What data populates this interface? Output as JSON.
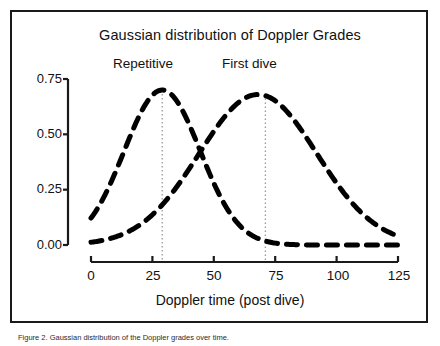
{
  "figure": {
    "title": "Gaussian distribution of Doppler Grades",
    "caption": "Figure 2. Gaussian distribution of the Doppler grades over time.",
    "frame_color": "#1a1a1a",
    "background": "#ffffff",
    "curve_color": "#000000",
    "dropline_color": "#9a9a9a"
  },
  "axes": {
    "x_label": "Doppler time (post dive)",
    "x_ticks": [
      "0",
      "25",
      "50",
      "75",
      "100",
      "125"
    ],
    "y_ticks": [
      "0.75",
      "0.50",
      "0.25",
      "0.00"
    ]
  },
  "annotations": {
    "repetitive": "Repetitive",
    "first_dive": "First dive"
  },
  "chart_data": {
    "type": "line",
    "title": "Gaussian distribution of Doppler Grades",
    "xlabel": "Doppler time (post dive)",
    "ylabel": "",
    "xlim": [
      0,
      125
    ],
    "ylim": [
      0.0,
      0.75
    ],
    "xticks": [
      0,
      25,
      50,
      75,
      100,
      125
    ],
    "yticks": [
      0.0,
      0.25,
      0.5,
      0.75
    ],
    "grid": false,
    "legend": "inline annotations above each peak",
    "linestyle": "dashed",
    "linewidth_px": 5,
    "series": [
      {
        "name": "Repetitive",
        "label_position": {
          "x": 22,
          "y": 0.78
        },
        "dropline_x": 29,
        "peak": {
          "x": 29,
          "y": 0.7
        },
        "gaussian": {
          "mu": 29,
          "sigma": 15.5,
          "amplitude": 0.7
        },
        "x": [
          0,
          5,
          10,
          15,
          20,
          25,
          29,
          35,
          40,
          45,
          50,
          55,
          60,
          65,
          70,
          75,
          80,
          85,
          90,
          95,
          100,
          105,
          110
        ],
        "y": [
          0.02,
          0.08,
          0.17,
          0.3,
          0.47,
          0.63,
          0.7,
          0.65,
          0.55,
          0.43,
          0.3,
          0.2,
          0.12,
          0.07,
          0.04,
          0.02,
          0.01,
          0.01,
          0.0,
          0.0,
          0.0,
          0.0,
          0.0
        ]
      },
      {
        "name": "First dive",
        "label_position": {
          "x": 64,
          "y": 0.78
        },
        "dropline_x": 71,
        "peak": {
          "x": 71,
          "y": 0.68
        },
        "gaussian": {
          "mu": 68,
          "sigma": 24.0,
          "amplitude": 0.68
        },
        "x": [
          0,
          5,
          10,
          15,
          20,
          25,
          30,
          35,
          40,
          45,
          50,
          55,
          60,
          65,
          70,
          75,
          80,
          85,
          90,
          95,
          100,
          105,
          110,
          115,
          120,
          125
        ],
        "y": [
          0.01,
          0.03,
          0.05,
          0.08,
          0.12,
          0.17,
          0.24,
          0.31,
          0.39,
          0.46,
          0.54,
          0.61,
          0.66,
          0.68,
          0.68,
          0.66,
          0.62,
          0.56,
          0.49,
          0.41,
          0.33,
          0.26,
          0.2,
          0.15,
          0.12,
          0.1
        ]
      }
    ]
  }
}
